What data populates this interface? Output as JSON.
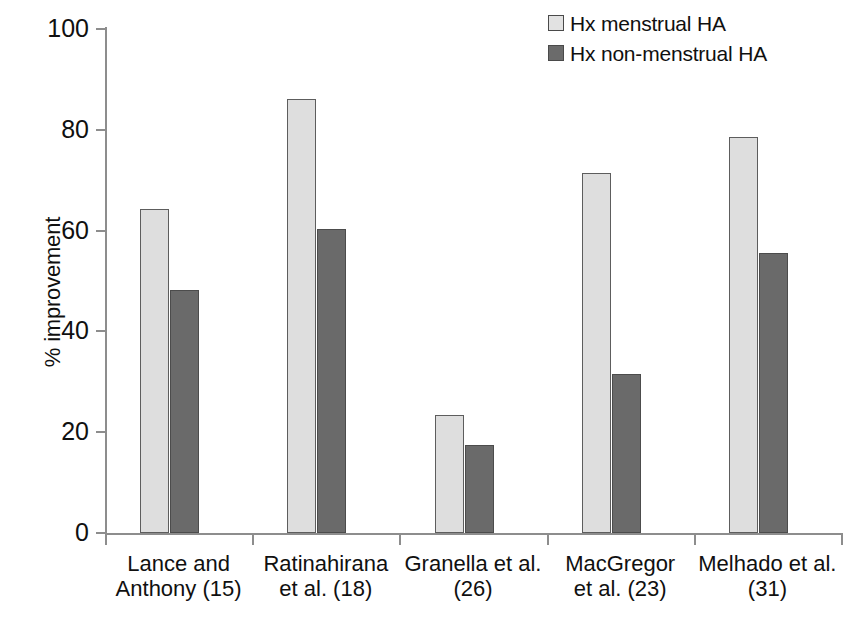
{
  "chart_data": {
    "type": "bar",
    "title": "",
    "subtitle": "",
    "xlabel": "",
    "ylabel": "% improvement",
    "ylim": [
      0,
      100
    ],
    "yticks": [
      0,
      20,
      40,
      60,
      80,
      100
    ],
    "grid": false,
    "legend_position": "top-right",
    "categories": [
      "Lance and Anthony (15)",
      "Ratinahirana et al. (18)",
      "Granella et al. (26)",
      "MacGregor et al. (23)",
      "Melhado et al. (31)"
    ],
    "category_lines": [
      [
        "Lance and",
        "Anthony (15)"
      ],
      [
        "Ratinahirana",
        "et al. (18)"
      ],
      [
        "Granella et al.",
        "(26)"
      ],
      [
        "MacGregor",
        "et al. (23)"
      ],
      [
        "Melhado et al.",
        "(31)"
      ]
    ],
    "series": [
      {
        "name": "Hx menstrual HA",
        "color": "#dedede",
        "values": [
          64.2,
          86.2,
          23.4,
          71.4,
          78.6
        ]
      },
      {
        "name": "Hx non-menstrual HA",
        "color": "#6a6a6a",
        "values": [
          48.2,
          60.4,
          17.4,
          31.6,
          55.6
        ]
      }
    ]
  },
  "legend": {
    "items": [
      {
        "label": "Hx menstrual HA",
        "swatch": "series-light"
      },
      {
        "label": "Hx non-menstrual HA",
        "swatch": "series-dark"
      }
    ]
  },
  "axes": {
    "y_title": "% improvement",
    "y_tick_labels": [
      "100",
      "80",
      "60",
      "40",
      "20",
      "0"
    ]
  },
  "caption": {
    "partial_text": ""
  },
  "colors": {
    "series_light": "#dedede",
    "series_dark": "#6a6a6a",
    "axis": "#8d8d8d",
    "text": "#101010",
    "background": "#ffffff"
  }
}
